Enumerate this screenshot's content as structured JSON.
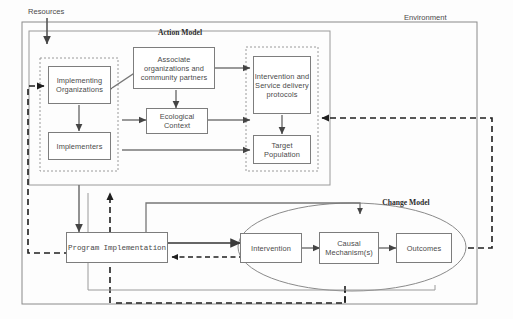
{
  "diagram": {
    "title_outer": "Environment",
    "input_label": "Resources",
    "groups": {
      "action_model": "Action Model",
      "change_model": "Change Model"
    }
  },
  "nodes": {
    "implementing_organizations": "Implementing\nOrganizations",
    "implementers": "Implementers",
    "associate_organizations": "Associate\norganizations and\ncommunity partners",
    "ecological_context": "Ecological\nContext",
    "intervention_protocols": "Intervention\nand Service\ndelivery\nprotocols",
    "target_population": "Target\nPopulation",
    "program_implementation": "Program Implementation",
    "intervention": "Intervention",
    "causal_mechanisms": "Causal\nMechanism(s)",
    "outcomes": "Outcomes"
  },
  "colors": {
    "stroke": "#6f6f6f",
    "box_stroke": "#7d7d7d",
    "arrow": "#555555",
    "dashed": "#2e2e2e",
    "text": "#4a4a4a",
    "background": "#ffffff"
  }
}
